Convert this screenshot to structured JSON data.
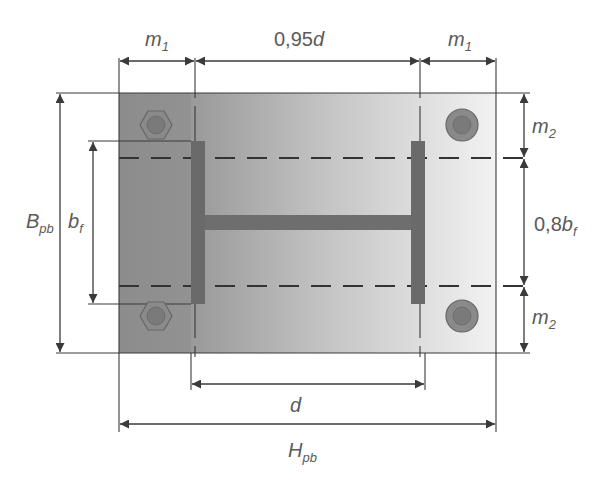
{
  "diagram": {
    "labels": {
      "m1_left": {
        "main": "m",
        "sub": "1"
      },
      "center_top": {
        "main": "0,95",
        "var": "d"
      },
      "m1_right": {
        "main": "m",
        "sub": "1"
      },
      "m2_top": {
        "main": "m",
        "sub": "2"
      },
      "center_right": {
        "main": "0,8",
        "var": "b",
        "sub": "f"
      },
      "m2_bottom": {
        "main": "m",
        "sub": "2"
      },
      "Bpb": {
        "main": "B",
        "sub": "pb"
      },
      "bf": {
        "main": "b",
        "sub": "f"
      },
      "d": {
        "main": "d"
      },
      "Hpb": {
        "main": "H",
        "sub": "pb"
      }
    },
    "components": [
      "base-plate",
      "left-flange",
      "right-flange",
      "web",
      "bolt-top-left",
      "bolt-top-right",
      "bolt-bottom-left",
      "bolt-bottom-right"
    ],
    "colors": {
      "plate_dark": "#8c8c8c",
      "plate_light": "#f0f0f0",
      "steel": "#6a6a6a",
      "line": "#3a3a3a",
      "text": "#5a5a5a"
    }
  }
}
